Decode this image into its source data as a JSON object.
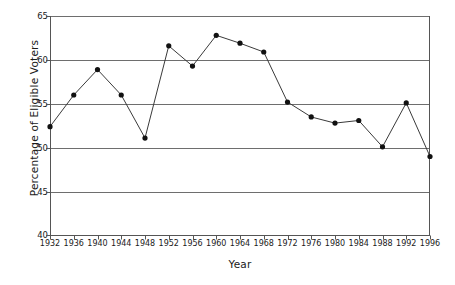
{
  "chart_data": {
    "type": "line",
    "title": "",
    "xlabel": "Year",
    "ylabel": "Percentage of Eligible Voters",
    "categories": [
      "1932",
      "1936",
      "1940",
      "1944",
      "1948",
      "1952",
      "1956",
      "1960",
      "1964",
      "1968",
      "1972",
      "1976",
      "1980",
      "1984",
      "1988",
      "1992",
      "1996"
    ],
    "x": [
      1932,
      1936,
      1940,
      1944,
      1948,
      1952,
      1956,
      1960,
      1964,
      1968,
      1972,
      1976,
      1980,
      1984,
      1988,
      1992,
      1996
    ],
    "values": [
      52.4,
      56.0,
      58.9,
      56.0,
      51.1,
      61.6,
      59.3,
      62.8,
      61.9,
      60.9,
      55.2,
      53.5,
      52.8,
      53.1,
      50.1,
      55.1,
      49.0
    ],
    "xlim": [
      1932,
      1996
    ],
    "ylim": [
      40,
      65
    ],
    "yticks": [
      40,
      45,
      50,
      55,
      60,
      65
    ],
    "ytick_labels": [
      "40",
      "45",
      "50",
      "55",
      "60",
      "65"
    ],
    "xticks": [
      1932,
      1936,
      1940,
      1944,
      1948,
      1952,
      1956,
      1960,
      1964,
      1968,
      1972,
      1976,
      1980,
      1984,
      1988,
      1992,
      1996
    ],
    "grid": "horizontal",
    "legend": "none",
    "marker": "filled-circle",
    "line_color": "#3a3a3a",
    "marker_color": "#111111",
    "grid_color": "#6e6e6e",
    "axis_color": "#555555",
    "background": "#ffffff"
  }
}
